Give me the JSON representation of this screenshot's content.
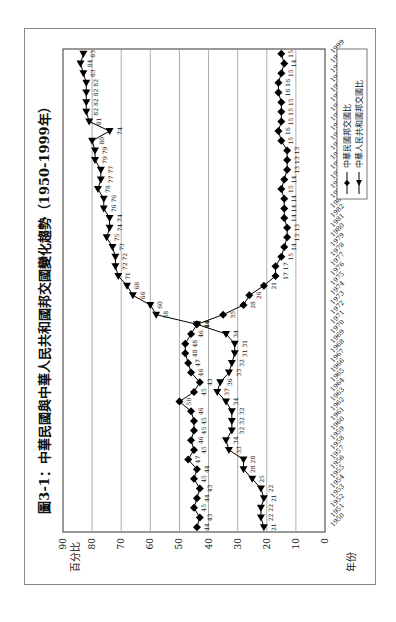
{
  "chart_data": {
    "type": "line",
    "title": "圖3-1：中華民國與中華人民共和國邦交國變化趨勢（1950-1999年）",
    "ylabel": "百分比",
    "xlabel": "年份",
    "ylim": [
      0,
      90
    ],
    "yticks": [
      0,
      10,
      20,
      30,
      40,
      50,
      60,
      70,
      80,
      90
    ],
    "grid": true,
    "orientation": "rotated-90-ccw",
    "legend_position": "bottom-right",
    "x": [
      1950,
      1951,
      1952,
      1953,
      1954,
      1955,
      1956,
      1957,
      1958,
      1959,
      1960,
      1961,
      1962,
      1963,
      1964,
      1965,
      1966,
      1967,
      1968,
      1969,
      1970,
      1971,
      1972,
      1973,
      1974,
      1975,
      1976,
      1977,
      1978,
      1979,
      1980,
      1981,
      1982,
      1983,
      1984,
      1985,
      1986,
      1987,
      1988,
      1989,
      1990,
      1991,
      1992,
      1993,
      1994,
      1995,
      1996,
      1997,
      1998,
      1999
    ],
    "series": [
      {
        "name": "中華民國邦交國比",
        "marker": "diamond",
        "values": [
          44,
          43,
          45,
          44,
          43,
          45,
          44,
          47,
          45,
          46,
          45,
          45,
          46,
          50,
          45,
          43,
          46,
          47,
          48,
          48,
          46,
          44,
          35,
          28,
          26,
          21,
          17,
          17,
          15,
          14,
          13,
          13,
          14,
          14,
          14,
          15,
          14,
          13,
          13,
          13,
          15,
          16,
          15,
          15,
          15,
          16,
          16,
          15,
          14,
          15
        ]
      },
      {
        "name": "中華人民共和國邦交國比",
        "marker": "triangle",
        "values": [
          21,
          22,
          22,
          21,
          22,
          25,
          28,
          28,
          33,
          34,
          32,
          32,
          32,
          34,
          37,
          36,
          33,
          32,
          31,
          31,
          34,
          44,
          58,
          60,
          66,
          68,
          71,
          72,
          72,
          73,
          75,
          74,
          74,
          76,
          76,
          78,
          77,
          77,
          79,
          79,
          80,
          74,
          81,
          82,
          82,
          82,
          82,
          83,
          84,
          83
        ]
      }
    ]
  }
}
